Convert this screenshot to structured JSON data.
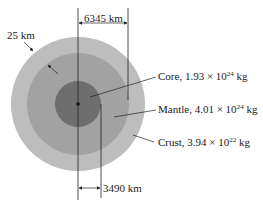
{
  "figure": {
    "colors": {
      "crust": "#bdbdbd",
      "mantle": "#a2a2a2",
      "core": "#6e6e6e",
      "lines": "#222222",
      "background": "#ffffff"
    },
    "dimensions": {
      "outer_radius_label": "6345 km",
      "core_radius_label": "3490 km",
      "crust_thickness_label": "25 km"
    },
    "layers": [
      {
        "name": "Core",
        "prefix": "Core, 1.93 × 10",
        "exponent": "24",
        "unit": " kg"
      },
      {
        "name": "Mantle",
        "prefix": "Mantle, 4.01 × 10",
        "exponent": "24",
        "unit": " kg"
      },
      {
        "name": "Crust",
        "prefix": "Crust, 3.94 × 10",
        "exponent": "22",
        "unit": " kg"
      }
    ]
  }
}
